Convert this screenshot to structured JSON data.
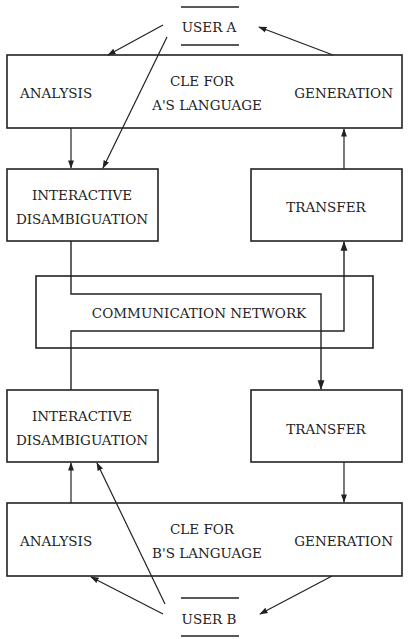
{
  "user_a": {
    "label": "USER A"
  },
  "user_b": {
    "label": "USER B"
  },
  "cle_a": {
    "title_line1": "CLE FOR",
    "title_line2": "A'S LANGUAGE",
    "analysis": "ANALYSIS",
    "generation": "GENERATION"
  },
  "cle_b": {
    "title_line1": "CLE FOR",
    "title_line2": "B'S LANGUAGE",
    "analysis": "ANALYSIS",
    "generation": "GENERATION"
  },
  "disamb_a": {
    "line1": "INTERACTIVE",
    "line2": "DISAMBIGUATION"
  },
  "disamb_b": {
    "line1": "INTERACTIVE",
    "line2": "DISAMBIGUATION"
  },
  "transfer_a": {
    "label": "TRANSFER"
  },
  "transfer_b": {
    "label": "TRANSFER"
  },
  "network": {
    "label": "COMMUNICATION NETWORK"
  }
}
